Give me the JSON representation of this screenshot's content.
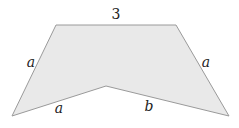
{
  "diagram": {
    "shape": "concave pentagon",
    "fill": "#e9e9e9",
    "stroke": "#9a9a9a",
    "vertices": [
      [
        56,
        25
      ],
      [
        176,
        25
      ],
      [
        229,
        116
      ],
      [
        106,
        86
      ],
      [
        12,
        116
      ]
    ],
    "labels": {
      "top": "3",
      "left_side": "a",
      "right_side": "a",
      "bottom_left": "a",
      "bottom_right": "b"
    }
  }
}
